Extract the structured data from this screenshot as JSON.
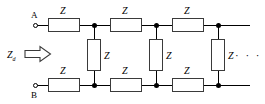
{
  "diagram": {
    "terminals": [
      {
        "name": "A",
        "label": "A"
      },
      {
        "name": "B",
        "label": "B"
      }
    ],
    "input_impedance": {
      "symbol": "Z",
      "subscript": "d",
      "arrow": "right-arrow"
    },
    "series_top": [
      {
        "label": "Z"
      },
      {
        "label": "Z"
      },
      {
        "label": "Z"
      }
    ],
    "series_bottom": [
      {
        "label": "Z"
      },
      {
        "label": "Z"
      },
      {
        "label": "Z"
      }
    ],
    "shunt": [
      {
        "label": "Z"
      },
      {
        "label": "Z"
      },
      {
        "label": "Z"
      }
    ],
    "continuation": "· · ·",
    "colors": {
      "wire": "#000000",
      "component_outline": "#3a3a3a",
      "background": "#ffffff",
      "text": "#000000"
    }
  }
}
